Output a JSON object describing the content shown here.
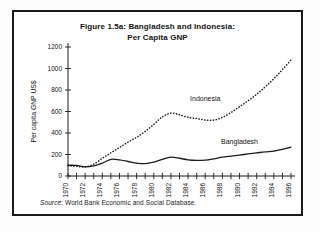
{
  "figure": {
    "title_line1": "Figure 1.5a: Bangladesh and Indonesia:",
    "title_line2": "Per Capita GNP",
    "source_prefix": "Source",
    "source_text": ": World Bank Economic and Social Database."
  },
  "chart_data": {
    "type": "line",
    "title": "Figure 1.5a: Bangladesh and Indonesia: Per Capita GNP",
    "xlabel": "",
    "ylabel": "Per capita GNP  US$",
    "ylim": [
      0,
      1200
    ],
    "xlim": [
      1970,
      1996
    ],
    "ytick_labels": [
      "0",
      "200",
      "400",
      "600",
      "800",
      "1000",
      "1200"
    ],
    "yticks": [
      0,
      200,
      400,
      600,
      800,
      1000,
      1200
    ],
    "xtick_labels": [
      "1970",
      "1972",
      "1974",
      "1976",
      "1978",
      "1980",
      "1982",
      "1984",
      "1986",
      "1988",
      "1990",
      "1992",
      "1994",
      "1996"
    ],
    "xticks_labeled": [
      1970,
      1972,
      1974,
      1976,
      1978,
      1980,
      1982,
      1984,
      1986,
      1988,
      1990,
      1992,
      1994,
      1996
    ],
    "xticks_minor_every": 1,
    "grid": false,
    "legend_position": "inline-annotation",
    "x": [
      1970,
      1971,
      1972,
      1973,
      1974,
      1975,
      1976,
      1977,
      1978,
      1979,
      1980,
      1981,
      1982,
      1983,
      1984,
      1985,
      1986,
      1987,
      1988,
      1989,
      1990,
      1991,
      1992,
      1993,
      1994,
      1995,
      1996
    ],
    "series": [
      {
        "name": "Indonesia",
        "style": "dotted",
        "label_x": 1986,
        "label_y": 700,
        "values": [
          95,
          90,
          85,
          110,
          165,
          215,
          265,
          315,
          360,
          415,
          480,
          550,
          585,
          570,
          545,
          535,
          520,
          520,
          545,
          590,
          645,
          700,
          760,
          830,
          905,
          990,
          1080
        ]
      },
      {
        "name": "Bangladesh",
        "style": "solid",
        "label_x": 1990,
        "label_y": 300,
        "values": [
          100,
          98,
          85,
          95,
          120,
          155,
          150,
          135,
          120,
          115,
          130,
          155,
          175,
          165,
          150,
          145,
          148,
          160,
          175,
          185,
          195,
          205,
          215,
          225,
          232,
          248,
          268
        ]
      }
    ]
  }
}
